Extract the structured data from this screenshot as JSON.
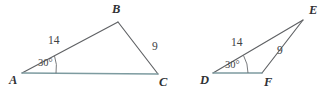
{
  "figure": {
    "background_color": "#ffffff",
    "stroke_color": "#5f6164",
    "base_stroke_color": "#7d9ba0",
    "text_color": "#3b3d40"
  },
  "triangles": [
    {
      "id": "triangle-abc",
      "name": "Triangle ABC",
      "vertices": [
        {
          "label": "A",
          "x": 22,
          "y": 73
        },
        {
          "label": "B",
          "x": 118,
          "y": 22
        },
        {
          "label": "C",
          "x": 158,
          "y": 74
        }
      ],
      "vertex_labels": [
        {
          "label": "A",
          "x": 9,
          "y": 74
        },
        {
          "label": "B",
          "x": 112,
          "y": 3
        },
        {
          "label": "C",
          "x": 159,
          "y": 76
        }
      ],
      "sides": [
        {
          "from": "A",
          "to": "B",
          "label": "14",
          "label_x": 48,
          "label_y": 35
        },
        {
          "from": "B",
          "to": "C",
          "label": "9",
          "label_x": 152,
          "label_y": 41
        },
        {
          "from": "A",
          "to": "C",
          "label": "",
          "label_x": 0,
          "label_y": 0
        }
      ],
      "angles": [
        {
          "at": "A",
          "label": "30°",
          "label_x": 38,
          "label_y": 58
        }
      ]
    },
    {
      "id": "triangle-def",
      "name": "Triangle DEF",
      "vertices": [
        {
          "label": "D",
          "x": 213,
          "y": 73
        },
        {
          "label": "E",
          "x": 303,
          "y": 20
        },
        {
          "label": "F",
          "x": 262,
          "y": 73
        }
      ],
      "vertex_labels": [
        {
          "label": "D",
          "x": 200,
          "y": 74
        },
        {
          "label": "E",
          "x": 309,
          "y": 4
        },
        {
          "label": "F",
          "x": 264,
          "y": 76
        }
      ],
      "sides": [
        {
          "from": "D",
          "to": "E",
          "label": "14",
          "label_x": 231,
          "label_y": 37
        },
        {
          "from": "F",
          "to": "E",
          "label": "9",
          "label_x": 277,
          "label_y": 45
        },
        {
          "from": "D",
          "to": "F",
          "label": "",
          "label_x": 0,
          "label_y": 0
        }
      ],
      "angles": [
        {
          "at": "D",
          "label": "30°",
          "label_x": 225,
          "label_y": 60
        }
      ]
    }
  ]
}
